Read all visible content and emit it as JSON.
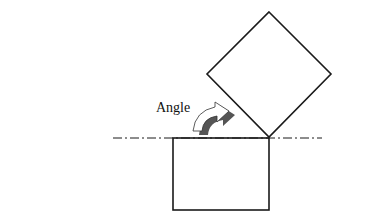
{
  "figure": {
    "label": "Angle",
    "shapes": {
      "diamond": {
        "top": [
          269,
          12
        ],
        "right": [
          331,
          74
        ],
        "bottom": [
          269,
          137
        ],
        "left": [
          207,
          74
        ]
      },
      "square": {
        "x": 173,
        "y": 138,
        "width": 96,
        "height": 72
      },
      "reference_line": {
        "x1": 113,
        "x2": 322,
        "y": 138,
        "style": "dash-dot"
      },
      "rotation_arrow": {
        "direction": "clockwise",
        "from": [
          193,
          130
        ],
        "to": [
          232,
          107
        ]
      }
    },
    "colors": {
      "stroke": "#1a1a1a",
      "arrow_fill": "#ffffff",
      "arrow_shadow": "#555555",
      "background": "#ffffff"
    }
  }
}
